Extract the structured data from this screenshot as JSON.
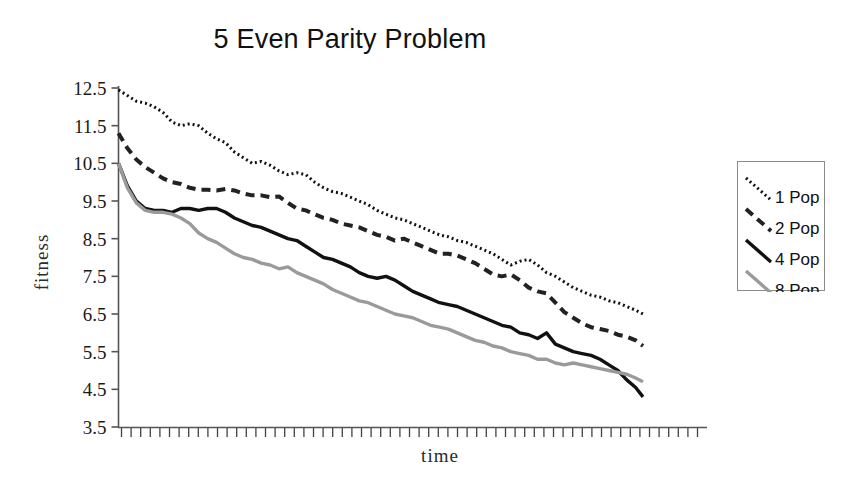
{
  "chart_data": {
    "type": "line",
    "title": "5 Even Parity Problem",
    "xlabel": "time",
    "ylabel": "fitness",
    "grid": false,
    "legend_position": "right",
    "ylim": [
      3.5,
      12.5
    ],
    "yticks": [
      "12.5",
      "11.5",
      "10.5",
      "9.5",
      "8.5",
      "7.5",
      "6.5",
      "5.5",
      "4.5",
      "3.5"
    ],
    "ytick_values": [
      12.5,
      11.5,
      10.5,
      9.5,
      8.5,
      7.5,
      6.5,
      5.5,
      4.5,
      3.5
    ],
    "xticks": [],
    "xlim": [
      0,
      100
    ],
    "x": [
      0,
      1.7,
      3.4,
      5.1,
      6.8,
      8.5,
      10.2,
      11.9,
      13.6,
      15.3,
      17,
      18.7,
      20.4,
      22.1,
      23.8,
      25.5,
      27.2,
      28.9,
      30.6,
      32.3,
      34,
      35.7,
      37.4,
      39.1,
      40.8,
      42.5,
      44.2,
      45.9,
      47.6,
      49.3,
      51,
      52.7,
      54.4,
      56.1,
      57.8,
      59.5,
      61.2,
      62.9,
      64.6,
      66.3,
      68,
      69.7,
      71.4,
      73.1,
      74.8,
      76.5,
      78.2,
      79.9,
      81.6,
      83.3,
      85,
      86.7,
      88.4,
      90.1,
      91.8,
      93.5,
      95.2,
      96.9,
      98.6,
      100
    ],
    "series": [
      {
        "name": "1 Pop",
        "style": "dotted",
        "color": "#111111",
        "values": [
          12.45,
          12.3,
          12.15,
          12.1,
          12.0,
          11.85,
          11.6,
          11.5,
          11.55,
          11.5,
          11.3,
          11.15,
          11.05,
          10.8,
          10.65,
          10.5,
          10.55,
          10.45,
          10.3,
          10.2,
          10.25,
          10.2,
          10.0,
          9.85,
          9.75,
          9.7,
          9.6,
          9.5,
          9.4,
          9.25,
          9.15,
          9.05,
          9.0,
          8.9,
          8.8,
          8.7,
          8.6,
          8.55,
          8.45,
          8.4,
          8.3,
          8.2,
          8.1,
          7.95,
          7.8,
          7.9,
          7.95,
          7.8,
          7.6,
          7.5,
          7.35,
          7.2,
          7.1,
          7.0,
          6.95,
          6.85,
          6.8,
          6.7,
          6.6,
          6.5
        ]
      },
      {
        "name": "2 Pop",
        "style": "dashed",
        "color": "#222222",
        "values": [
          11.3,
          10.9,
          10.6,
          10.4,
          10.25,
          10.1,
          10.0,
          9.95,
          9.85,
          9.8,
          9.8,
          9.78,
          9.82,
          9.78,
          9.7,
          9.65,
          9.65,
          9.6,
          9.62,
          9.45,
          9.3,
          9.25,
          9.15,
          9.05,
          9.0,
          8.9,
          8.85,
          8.8,
          8.7,
          8.6,
          8.55,
          8.45,
          8.5,
          8.4,
          8.3,
          8.2,
          8.1,
          8.1,
          8.05,
          7.95,
          7.85,
          7.7,
          7.55,
          7.5,
          7.55,
          7.4,
          7.2,
          7.1,
          7.05,
          6.8,
          6.55,
          6.4,
          6.25,
          6.15,
          6.1,
          6.05,
          5.95,
          5.9,
          5.8,
          5.65
        ]
      },
      {
        "name": "4 Pop",
        "style": "solid",
        "color": "#111111",
        "values": [
          10.5,
          9.9,
          9.5,
          9.3,
          9.25,
          9.25,
          9.2,
          9.3,
          9.3,
          9.25,
          9.3,
          9.3,
          9.2,
          9.05,
          8.95,
          8.85,
          8.8,
          8.7,
          8.6,
          8.5,
          8.45,
          8.3,
          8.15,
          8.0,
          7.95,
          7.85,
          7.75,
          7.6,
          7.5,
          7.45,
          7.5,
          7.4,
          7.25,
          7.1,
          7.0,
          6.9,
          6.8,
          6.75,
          6.7,
          6.6,
          6.5,
          6.4,
          6.3,
          6.2,
          6.15,
          6.0,
          5.95,
          5.85,
          6.0,
          5.7,
          5.6,
          5.5,
          5.45,
          5.4,
          5.3,
          5.15,
          5.0,
          4.75,
          4.55,
          4.3
        ]
      },
      {
        "name": "8 Pop",
        "style": "solid",
        "color": "#9a9a9a",
        "values": [
          10.5,
          9.85,
          9.45,
          9.25,
          9.2,
          9.2,
          9.15,
          9.05,
          8.9,
          8.65,
          8.5,
          8.4,
          8.25,
          8.1,
          8.0,
          7.95,
          7.85,
          7.8,
          7.7,
          7.75,
          7.6,
          7.5,
          7.4,
          7.3,
          7.15,
          7.05,
          6.95,
          6.85,
          6.8,
          6.7,
          6.6,
          6.5,
          6.45,
          6.4,
          6.3,
          6.2,
          6.15,
          6.1,
          6.0,
          5.9,
          5.8,
          5.75,
          5.65,
          5.6,
          5.5,
          5.45,
          5.4,
          5.3,
          5.3,
          5.2,
          5.15,
          5.2,
          5.15,
          5.1,
          5.05,
          5.0,
          4.95,
          4.9,
          4.8,
          4.7
        ]
      }
    ]
  },
  "legend": {
    "items": [
      {
        "label": "1 Pop",
        "style": "dotted",
        "color": "#111111"
      },
      {
        "label": "2 Pop",
        "style": "dashed",
        "color": "#222222"
      },
      {
        "label": "4 Pop",
        "style": "solid",
        "color": "#111111"
      },
      {
        "label": "8 Pop",
        "style": "solid",
        "color": "#9a9a9a"
      }
    ]
  }
}
